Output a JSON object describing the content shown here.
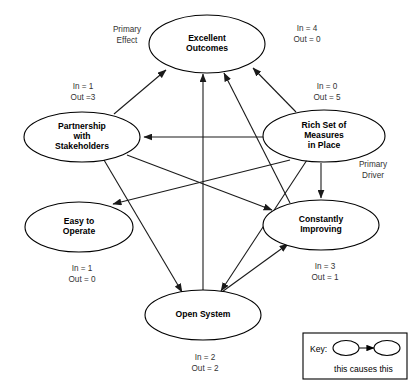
{
  "diagram": {
    "title": "",
    "nodes": [
      {
        "id": "excellent-outcomes",
        "lines": [
          "Excellent",
          "Outcomes"
        ],
        "cx": 207,
        "cy": 44,
        "rx": 58,
        "ry": 29,
        "in_label": "In = 4",
        "out_label": "Out = 0",
        "io_x": 307,
        "io_y": 31
      },
      {
        "id": "partnership-with-stakeholders",
        "lines": [
          "Partnership",
          "with",
          "Stakeholders"
        ],
        "cx": 82,
        "cy": 137,
        "rx": 58,
        "ry": 25,
        "in_label": "In = 1",
        "out_label": "Out =3",
        "io_x": 83,
        "io_y": 89
      },
      {
        "id": "rich-set-of-measures-in-place",
        "lines": [
          "Rich Set of",
          "Measures",
          "in Place"
        ],
        "cx": 324,
        "cy": 136,
        "rx": 61,
        "ry": 26,
        "in_label": "In = 0",
        "out_label": "Out = 5",
        "io_x": 327,
        "io_y": 89
      },
      {
        "id": "easy-to-operate",
        "lines": [
          "Easy to",
          "Operate"
        ],
        "cx": 79,
        "cy": 227,
        "rx": 54,
        "ry": 25,
        "in_label": "In = 1",
        "out_label": "Out = 0",
        "io_x": 82,
        "io_y": 271
      },
      {
        "id": "constantly-improving",
        "lines": [
          "Constantly",
          "Improving"
        ],
        "cx": 321,
        "cy": 225,
        "rx": 58,
        "ry": 25,
        "in_label": "In = 3",
        "out_label": "Out = 1",
        "io_x": 325,
        "io_y": 269
      },
      {
        "id": "open-system",
        "lines": [
          "Open System"
        ],
        "cx": 203,
        "cy": 315,
        "rx": 58,
        "ry": 25,
        "in_label": "In = 2",
        "out_label": "Out = 2",
        "io_x": 205,
        "io_y": 360
      }
    ],
    "annotations": [
      {
        "id": "primary-effect",
        "lines": [
          "Primary",
          "Effect"
        ],
        "x": 127,
        "y": 32
      },
      {
        "id": "primary-driver",
        "lines": [
          "Primary",
          "Driver"
        ],
        "x": 373,
        "y": 167
      }
    ],
    "edges": [
      {
        "id": "partnership-to-excellent-outcomes",
        "from": "partnership-with-stakeholders",
        "to": "excellent-outcomes",
        "x1": 114,
        "y1": 114,
        "x2": 166,
        "y2": 70
      },
      {
        "id": "rich-set-to-excellent-outcomes",
        "from": "rich-set-of-measures-in-place",
        "to": "excellent-outcomes",
        "x1": 296,
        "y1": 112,
        "x2": 253,
        "y2": 68
      },
      {
        "id": "open-system-to-excellent-outcomes",
        "from": "open-system",
        "to": "excellent-outcomes",
        "x1": 203,
        "y1": 290,
        "x2": 203,
        "y2": 74
      },
      {
        "id": "constantly-improving-to-excellent-outcomes",
        "from": "constantly-improving",
        "to": "excellent-outcomes",
        "x1": 290,
        "y1": 203,
        "x2": 224,
        "y2": 73
      },
      {
        "id": "rich-set-to-partnership",
        "from": "rich-set-of-measures-in-place",
        "to": "partnership-with-stakeholders",
        "x1": 300,
        "y1": 137,
        "x2": 144,
        "y2": 137
      },
      {
        "id": "rich-set-to-easy-to-operate",
        "from": "rich-set-of-measures-in-place",
        "to": "easy-to-operate",
        "x1": 290,
        "y1": 160,
        "x2": 113,
        "y2": 204
      },
      {
        "id": "rich-set-to-open-system",
        "from": "rich-set-of-measures-in-place",
        "to": "open-system",
        "x1": 307,
        "y1": 160,
        "x2": 221,
        "y2": 291
      },
      {
        "id": "rich-set-to-constantly-improving",
        "from": "rich-set-of-measures-in-place",
        "to": "constantly-improving",
        "x1": 321,
        "y1": 163,
        "x2": 321,
        "y2": 198
      },
      {
        "id": "partnership-to-open-system",
        "from": "partnership-with-stakeholders",
        "to": "open-system",
        "x1": 104,
        "y1": 160,
        "x2": 182,
        "y2": 292
      },
      {
        "id": "partnership-to-constantly-improving",
        "from": "partnership-with-stakeholders",
        "to": "constantly-improving",
        "x1": 127,
        "y1": 155,
        "x2": 272,
        "y2": 210
      },
      {
        "id": "open-system-to-constantly-improving",
        "from": "open-system",
        "to": "constantly-improving",
        "x1": 215,
        "y1": 297,
        "x2": 288,
        "y2": 244
      }
    ]
  },
  "key": {
    "label": "Key:",
    "caption": "this causes this",
    "box": {
      "x": 303,
      "y": 333,
      "w": 104,
      "h": 46
    }
  }
}
